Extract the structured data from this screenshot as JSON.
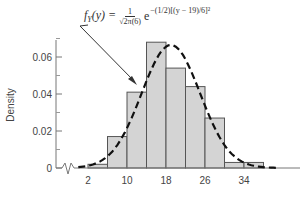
{
  "chart_data": {
    "type": "bar",
    "title": "",
    "xlabel": "",
    "ylabel": "Density",
    "x_tick_labels": [
      "2",
      "10",
      "18",
      "26",
      "34"
    ],
    "y_tick_labels": [
      "0",
      "0.02",
      "0.04",
      "0.06"
    ],
    "ylim": [
      0,
      0.07
    ],
    "xlim": [
      -2,
      44
    ],
    "axis_break_on_x": true,
    "grid": false,
    "bin_edges": [
      2,
      6,
      10,
      14,
      18,
      22,
      26,
      30,
      34,
      38
    ],
    "categories": [
      "2-6",
      "6-10",
      "10-14",
      "14-18",
      "18-22",
      "22-26",
      "26-30",
      "30-34",
      "34-38"
    ],
    "values": [
      0.002,
      0.017,
      0.041,
      0.068,
      0.054,
      0.044,
      0.027,
      0.003,
      0.003
    ],
    "overlay_curve": {
      "type": "normal_pdf",
      "mean": 19,
      "sd": 6,
      "style": "dashed",
      "label": "f_Y(y) = 1/(sqrt(2π)(6)) e^-(1/2)[(y − 19)/6]^2"
    },
    "annotations": [
      {
        "text": "fY(y) = 1/√2π(6) e^−(1/2)[(y − 19)/6]²",
        "arrow_to": "curve"
      }
    ]
  },
  "formula": {
    "lhs": "f",
    "sub": "Y",
    "arg": "(y) =",
    "num": "1",
    "den": "√2π(6)",
    "base": "e",
    "exponent": "−(1/2)[(y − 19)/6]²"
  },
  "axes": {
    "ylabel": "Density",
    "y_ticks": [
      {
        "label": "0.06",
        "value": 0.06
      },
      {
        "label": "0.04",
        "value": 0.04
      },
      {
        "label": "0.02",
        "value": 0.02
      },
      {
        "label": "0",
        "value": 0
      }
    ],
    "x_ticks": [
      {
        "label": "2",
        "value": 2
      },
      {
        "label": "10",
        "value": 10
      },
      {
        "label": "18",
        "value": 18
      },
      {
        "label": "26",
        "value": 26
      },
      {
        "label": "34",
        "value": 34
      }
    ]
  },
  "colors": {
    "bar_fill": "#d4d4d4",
    "bar_stroke": "#555555",
    "axis": "#777777",
    "curve": "#111111",
    "text": "#444444"
  }
}
